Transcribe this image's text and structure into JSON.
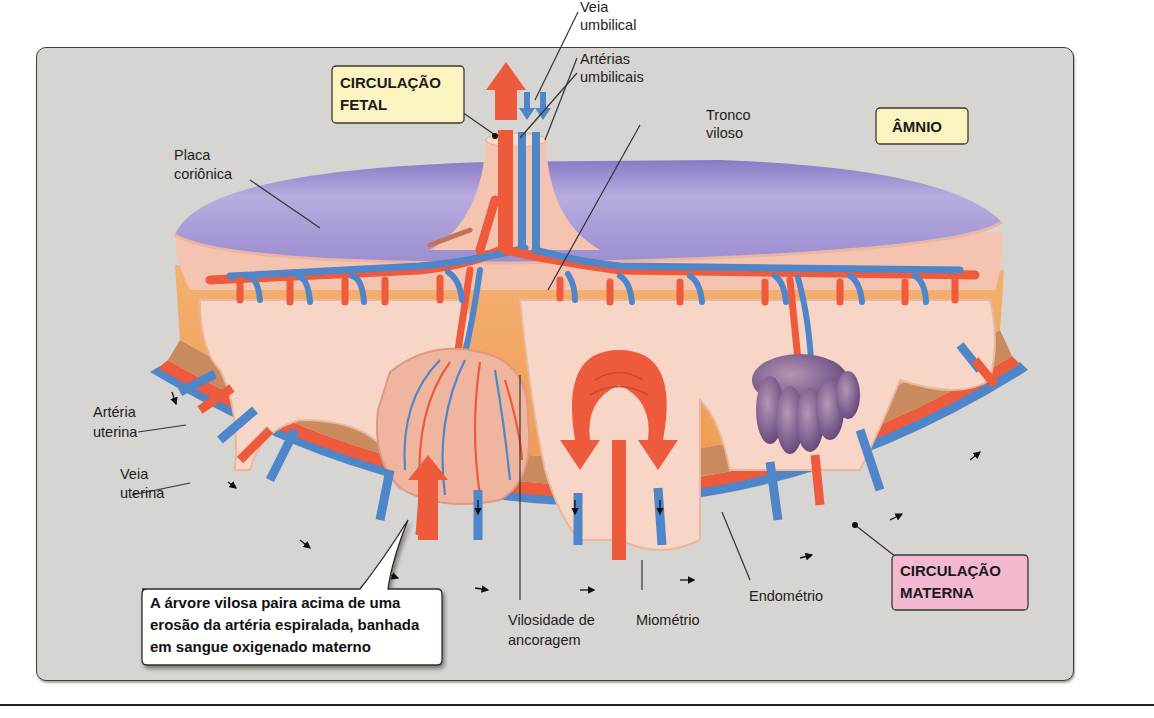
{
  "figure": {
    "title_boxes": {
      "fetal": {
        "line1": "CIRCULAÇÃO",
        "line2": "FETAL",
        "color": "#fbf3c0"
      },
      "amnion": {
        "text": "ÂMNIO",
        "color": "#fbf3c0"
      },
      "maternal": {
        "line1": "CIRCULAÇÃO",
        "line2": "MATERNA",
        "color": "#f2b8cf"
      }
    },
    "labels": {
      "umbilical_vein": [
        "Veia",
        "umbilical"
      ],
      "umbilical_arteries": [
        "Artérias",
        "umbilicais"
      ],
      "stem_villus": [
        "Tronco",
        "viloso"
      ],
      "chorionic_plate": [
        "Placa",
        "coriônica"
      ],
      "uterine_artery": [
        "Artéria",
        "uterina"
      ],
      "uterine_vein": [
        "Veia",
        "uterina"
      ],
      "anchoring_villus": [
        "Vilosidade de",
        "ancoragem"
      ],
      "myometrium": [
        "Miométrio"
      ],
      "endometrium": [
        "Endométrio"
      ]
    },
    "callout": {
      "lines": [
        "A árvore vilosa paira acima de uma",
        "erosão da artéria espiralada, banhada",
        "em sangue oxigenado materno"
      ]
    },
    "colors": {
      "artery": "#ee5a3c",
      "vein": "#4f86c9",
      "chorionic_plate": "#a799d6",
      "villus_tissue": "#f7d6c8",
      "decidua": "#f2a866",
      "myometrium_band": "#c98a5e",
      "background": "#d6d5d1"
    }
  }
}
